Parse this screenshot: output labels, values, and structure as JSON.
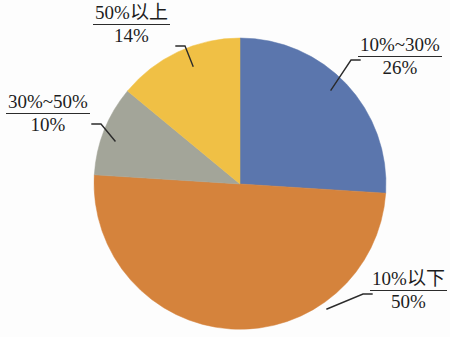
{
  "chart_data": {
    "type": "pie",
    "title": "",
    "subtitle": "",
    "xlabel": "",
    "ylabel": "",
    "legend_position": "none",
    "grid": false,
    "unit": "%",
    "start_angle_deg": 0,
    "direction": "clockwise",
    "categories": [
      "10%~30%",
      "10%以下",
      "30%~50%",
      "50%以上"
    ],
    "values": [
      26,
      50,
      10,
      14
    ],
    "labels": [
      "26%",
      "50%",
      "10%",
      "14%"
    ],
    "colors": [
      "#5b76ad",
      "#d5833c",
      "#a3a599",
      "#f0c045"
    ],
    "slices": [
      {
        "id": "slice-10-30",
        "name": "10%~30%",
        "value": 26,
        "value_label": "26%",
        "color": "#5b76ad",
        "start_deg": 0,
        "end_deg": 93.6
      },
      {
        "id": "slice-10-under",
        "name": "10%以下",
        "value": 50,
        "value_label": "50%",
        "color": "#d5833c",
        "start_deg": 93.6,
        "end_deg": 273.6
      },
      {
        "id": "slice-30-50",
        "name": "30%~50%",
        "value": 10,
        "value_label": "10%",
        "color": "#a3a599",
        "start_deg": 273.6,
        "end_deg": 309.6
      },
      {
        "id": "slice-50-plus",
        "name": "50%以上",
        "value": 14,
        "value_label": "14%",
        "color": "#f0c045",
        "start_deg": 309.6,
        "end_deg": 360
      }
    ]
  },
  "callouts": {
    "upper_left": {
      "name": "50%以上",
      "value": "14%"
    },
    "left": {
      "name": "30%~50%",
      "value": "10%"
    },
    "upper_right": {
      "name": "10%~30%",
      "value": "26%"
    },
    "lower_right": {
      "name": "10%以下",
      "value": "50%"
    }
  },
  "colors": {
    "blue": "#5b76ad",
    "orange": "#d5833c",
    "gray": "#a3a599",
    "yellow": "#f0c045",
    "leader_line": "#2b2b2b",
    "text": "#1d1d1d",
    "background": "#fdfdfd"
  }
}
